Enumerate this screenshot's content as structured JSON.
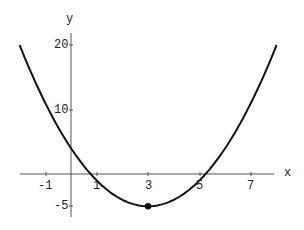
{
  "chart_data": {
    "type": "line",
    "title": "",
    "xlabel": "x",
    "ylabel": "y",
    "function": "y = (x-3)^2 - 5",
    "x_ticks": [
      "-1",
      "1",
      "3",
      "5",
      "7"
    ],
    "y_ticks": [
      "20",
      "10",
      "-5"
    ],
    "xlim": [
      -2,
      8
    ],
    "ylim": [
      -7,
      22
    ],
    "grid": false,
    "series": [
      {
        "name": "parabola",
        "x": [
          -2,
          -1,
          0,
          1,
          2,
          3,
          4,
          5,
          6,
          7,
          8
        ],
        "values": [
          20,
          11,
          4,
          -1,
          -4,
          -5,
          -4,
          -1,
          4,
          11,
          20
        ]
      }
    ],
    "points": [
      {
        "x": 3,
        "y": -5,
        "label": "vertex"
      }
    ]
  },
  "labels": {
    "x_axis": "x",
    "y_axis": "y",
    "xt": [
      "-1",
      "1",
      "3",
      "5",
      "7"
    ],
    "yt": [
      "20",
      "10",
      "-5"
    ]
  }
}
